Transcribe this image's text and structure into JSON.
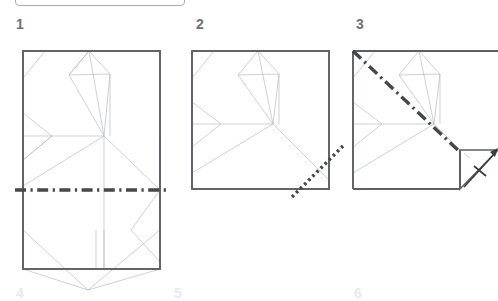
{
  "diagram": {
    "type": "origami-crease-pattern-sequence",
    "steps_visible": [
      "1",
      "2",
      "3"
    ],
    "steps_next_row_partial": [
      "4",
      "5",
      "6"
    ],
    "colors": {
      "paper_outline": "#5b5e63",
      "crease_light": "#b9bcc2",
      "fold_line": "#44474c",
      "label": "#6e7176",
      "background": "#ffffff",
      "ui_frame_border": "#a8aab0"
    }
  },
  "panels": [
    {
      "number": "1",
      "label_x": 17,
      "label_y": 23,
      "shape": "portrait-rectangle",
      "fold_line": {
        "style": "dash-dot",
        "orientation": "horizontal",
        "description": "horizontal dash-dot fold line across the middle of the sheet"
      }
    },
    {
      "number": "2",
      "label_x": 197,
      "label_y": 23,
      "shape": "square",
      "fold_line": {
        "style": "dotted",
        "orientation": "diagonal",
        "description": "dotted diagonal fold line at the lower right corner"
      }
    },
    {
      "number": "3",
      "label_x": 357,
      "label_y": 23,
      "shape": "square-with-flap",
      "fold_line": {
        "style": "dash-dot",
        "orientation": "diagonal",
        "description": "dash-dot diagonal fold line from the upper left corner to the lower right flap"
      },
      "arrow": {
        "style": "fold-and-unfold",
        "direction": "up-right",
        "description": "arrow with crossbar on the right flap"
      }
    }
  ],
  "next_row": {
    "numbers": [
      "4",
      "5",
      "6"
    ],
    "positions": [
      {
        "n": "4",
        "x": 17,
        "y": 288
      },
      {
        "n": "5",
        "x": 175,
        "y": 288
      },
      {
        "n": "6",
        "x": 355,
        "y": 288
      }
    ]
  }
}
